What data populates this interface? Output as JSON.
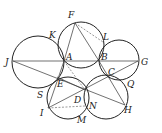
{
  "diagram": {
    "type": "geometry",
    "points": {
      "A": {
        "label": "A",
        "x": 64,
        "y": 61
      },
      "B": {
        "label": "B",
        "x": 99,
        "y": 61
      },
      "C": {
        "label": "C",
        "x": 108,
        "y": 76
      },
      "D": {
        "label": "D",
        "x": 85,
        "y": 90
      },
      "E": {
        "label": "E",
        "x": 57,
        "y": 77
      },
      "F": {
        "label": "F",
        "x": 75,
        "y": 23
      },
      "G": {
        "label": "G",
        "x": 138,
        "y": 61
      },
      "H": {
        "label": "H",
        "x": 125,
        "y": 105
      },
      "I": {
        "label": "I",
        "x": 48,
        "y": 108
      },
      "J": {
        "label": "J",
        "x": 13,
        "y": 61
      },
      "K": {
        "label": "K",
        "x": 56,
        "y": 40
      },
      "L": {
        "label": "L",
        "x": 103,
        "y": 42
      },
      "M": {
        "label": "M",
        "x": 80,
        "y": 118
      },
      "N": {
        "label": "N",
        "x": 85,
        "y": 106
      },
      "Q": {
        "label": "Q",
        "x": 124,
        "y": 80
      },
      "S": {
        "label": "S",
        "x": 46,
        "y": 92
      }
    },
    "labels": [
      "F",
      "K",
      "L",
      "J",
      "A",
      "B",
      "G",
      "C",
      "E",
      "Q",
      "S",
      "D",
      "N",
      "I",
      "M",
      "H"
    ]
  }
}
